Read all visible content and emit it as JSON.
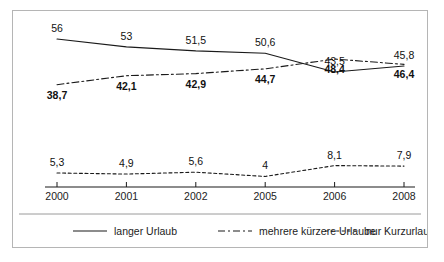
{
  "chart_data": {
    "type": "line",
    "title": "",
    "subtitle": "",
    "xlabel": "",
    "ylabel": "",
    "categories": [
      "2000",
      "2001",
      "2002",
      "2005",
      "2006",
      "2008"
    ],
    "ylim": [
      0,
      60
    ],
    "grid": false,
    "legend_position": "bottom",
    "series": [
      {
        "name": "langer Urlaub",
        "style": "solid",
        "label_bold": false,
        "label_position": "above",
        "values": [
          56,
          53,
          51.5,
          50.6,
          43.5,
          45.8
        ],
        "labels": [
          "56",
          "53",
          "51,5",
          "50,6",
          "43,5",
          "45,8"
        ]
      },
      {
        "name": "mehrere kürzere Urlaube",
        "style": "dash-dot",
        "label_bold": true,
        "label_position": "below",
        "values": [
          38.7,
          42.1,
          42.9,
          44.7,
          48.4,
          46.4
        ],
        "labels": [
          "38,7",
          "42,1",
          "42,9",
          "44,7",
          "48,4",
          "46,4"
        ]
      },
      {
        "name": "nur Kurzurlaube",
        "style": "dashed",
        "label_bold": false,
        "label_position": "above",
        "values": [
          5.3,
          4.9,
          5.6,
          4,
          8.1,
          7.9
        ],
        "labels": [
          "5,3",
          "4,9",
          "5,6",
          "4",
          "8,1",
          "7,9"
        ]
      }
    ],
    "legend": [
      {
        "label": "langer Urlaub",
        "style": "solid"
      },
      {
        "label": "mehrere kürzere Urlaube",
        "style": "dash-dot"
      },
      {
        "label": "nur Kurzurlaube",
        "style": "dashed"
      }
    ],
    "colors": {
      "line": "#1a1a1a",
      "axis": "#1a1a1a",
      "text": "#1c1c1c",
      "frame": "#b5b5b5",
      "background": "#ffffff"
    }
  }
}
